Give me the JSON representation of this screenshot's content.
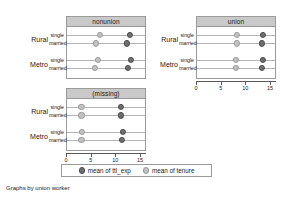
{
  "caption": "Graphs by union worker",
  "legend": {
    "items": [
      {
        "label": "mean of ttl_exp",
        "color": "#6f6f6f",
        "icon": "filled-circle-dark"
      },
      {
        "label": "mean of tenure",
        "color": "#c2c2c2",
        "icon": "filled-circle-light"
      }
    ]
  },
  "axis": {
    "ticks": [
      0,
      5,
      10,
      15
    ],
    "tick_labels": [
      "0",
      "5",
      "10",
      "15"
    ],
    "xmin": 0,
    "xmax": 16.2
  },
  "groups": [
    {
      "label": "Rural",
      "rows": [
        "single",
        "married"
      ]
    },
    {
      "label": "Metro",
      "rows": [
        "single",
        "married"
      ]
    }
  ],
  "chart_data": {
    "type": "scatter",
    "title": "",
    "xlabel": "",
    "ylabel": "",
    "xlim": [
      0,
      16.2
    ],
    "grid": false,
    "legend_position": "bottom",
    "facet_by": "union worker",
    "categories": [
      "Rural / single",
      "Rural / married",
      "Metro / single",
      "Metro / married"
    ],
    "panels": [
      {
        "title": "nonunion",
        "series": [
          {
            "name": "mean of ttl_exp",
            "color": "#6f6f6f",
            "values": [
              12.8,
              12.1,
              13.0,
              12.4
            ]
          },
          {
            "name": "mean of tenure",
            "color": "#c2c2c2",
            "values": [
              6.6,
              5.9,
              6.2,
              5.6
            ]
          }
        ]
      },
      {
        "title": "union",
        "series": [
          {
            "name": "mean of ttl_exp",
            "color": "#6f6f6f",
            "values": [
              13.3,
              13.2,
              13.4,
              13.2
            ]
          },
          {
            "name": "mean of tenure",
            "color": "#c2c2c2",
            "values": [
              8.1,
              8.0,
              7.9,
              7.8
            ]
          }
        ]
      },
      {
        "title": "(missing)",
        "series": [
          {
            "name": "mean of ttl_exp",
            "color": "#6f6f6f",
            "values": [
              10.9,
              10.9,
              11.3,
              11.1
            ]
          },
          {
            "name": "mean of tenure",
            "color": "#c2c2c2",
            "values": [
              2.9,
              2.9,
              3.0,
              2.9
            ]
          }
        ]
      }
    ]
  }
}
